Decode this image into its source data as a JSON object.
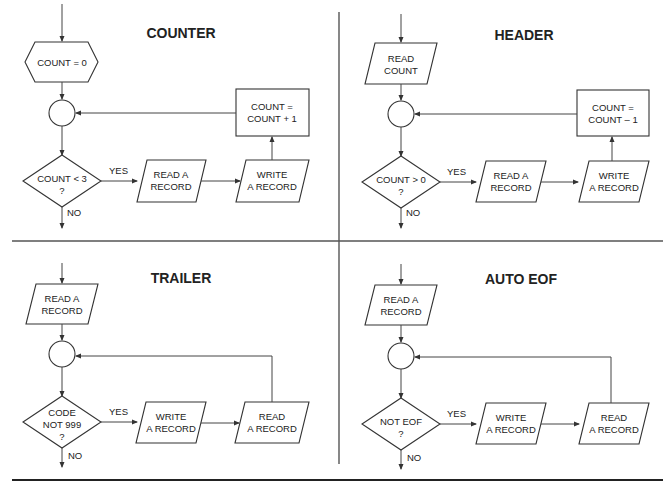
{
  "panels": [
    {
      "title": "COUNTER",
      "init": {
        "shape": "hexagon",
        "lines": [
          "COUNT = 0"
        ]
      },
      "decision": {
        "lines": [
          "COUNT < 3",
          "?"
        ]
      },
      "step1": {
        "lines": [
          "READ A",
          "RECORD"
        ]
      },
      "step2": {
        "lines": [
          "WRITE",
          "A RECORD"
        ]
      },
      "update": {
        "lines": [
          "COUNT =",
          "COUNT + 1"
        ]
      },
      "yes_label": "YES",
      "no_label": "NO"
    },
    {
      "title": "HEADER",
      "init": {
        "shape": "parallelogram",
        "lines": [
          "READ",
          "COUNT"
        ]
      },
      "decision": {
        "lines": [
          "COUNT > 0",
          "?"
        ]
      },
      "step1": {
        "lines": [
          "READ A",
          "RECORD"
        ]
      },
      "step2": {
        "lines": [
          "WRITE",
          "A RECORD"
        ]
      },
      "update": {
        "lines": [
          "COUNT =",
          "COUNT – 1"
        ]
      },
      "yes_label": "YES",
      "no_label": "NO"
    },
    {
      "title": "TRAILER",
      "init": {
        "shape": "parallelogram",
        "lines": [
          "READ A",
          "RECORD"
        ]
      },
      "decision": {
        "lines": [
          "CODE",
          "NOT 999",
          "?"
        ]
      },
      "step1": {
        "lines": [
          "WRITE",
          "A RECORD"
        ]
      },
      "step2": {
        "lines": [
          "READ",
          "A RECORD"
        ]
      },
      "yes_label": "YES",
      "no_label": "NO"
    },
    {
      "title": "AUTO EOF",
      "init": {
        "shape": "parallelogram",
        "lines": [
          "READ A",
          "RECORD"
        ]
      },
      "decision": {
        "lines": [
          "NOT EOF",
          "?"
        ]
      },
      "step1": {
        "lines": [
          "WRITE",
          "A RECORD"
        ]
      },
      "step2": {
        "lines": [
          "READ",
          "A RECORD"
        ]
      },
      "yes_label": "YES",
      "no_label": "NO"
    }
  ]
}
